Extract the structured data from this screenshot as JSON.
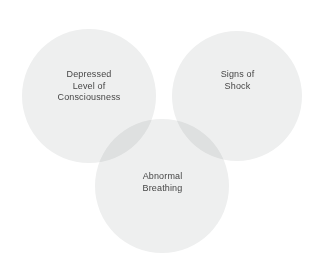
{
  "diagram": {
    "type": "venn",
    "title": "",
    "background_color": "#ffffff",
    "circle_fill_color": "#eeefef",
    "overlap_fill_color": "#dcdedd",
    "text_color": "#464646",
    "sets": [
      {
        "id": "depressed-level-of-consciousness",
        "position": "left",
        "lines": [
          "Depressed",
          "Level of",
          "Consciousness"
        ],
        "cx": 89,
        "cy": 96,
        "r": 67
      },
      {
        "id": "signs-of-shock",
        "position": "right",
        "lines": [
          "Signs of",
          "Shock"
        ],
        "cx": 237,
        "cy": 96,
        "r": 65
      },
      {
        "id": "abnormal-breathing",
        "position": "bottom",
        "lines": [
          "Abnormal",
          "Breathing"
        ],
        "cx": 162,
        "cy": 186,
        "r": 67
      }
    ],
    "overlaps": [
      {
        "id": "left-bottom",
        "between": [
          "depressed-level-of-consciousness",
          "abnormal-breathing"
        ]
      },
      {
        "id": "right-bottom",
        "between": [
          "signs-of-shock",
          "abnormal-breathing"
        ]
      }
    ]
  }
}
